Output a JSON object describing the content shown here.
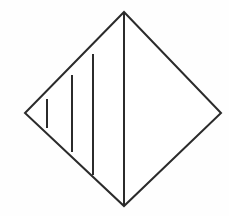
{
  "figure": {
    "name": "diamond-with-vertical-chords",
    "canvas": {
      "width": 229,
      "height": 216,
      "background_color": "#fefefe"
    },
    "style": {
      "stroke_color": "#2b2b2b",
      "stroke_width": 2,
      "fill_color": "#ffffff"
    },
    "outline": {
      "shape": "rhombus",
      "points": "124,12 221,113 124,206 25,113",
      "vertices": [
        {
          "label": "top",
          "x": 124,
          "y": 12
        },
        {
          "label": "right",
          "x": 221,
          "y": 113
        },
        {
          "label": "bottom",
          "x": 124,
          "y": 206
        },
        {
          "label": "left",
          "x": 25,
          "y": 113
        }
      ]
    },
    "chords": [
      {
        "label": "chord-1",
        "x": 47,
        "y1": 99,
        "y2": 128
      },
      {
        "label": "chord-2",
        "x": 72,
        "y1": 75,
        "y2": 152
      },
      {
        "label": "chord-3",
        "x": 93,
        "y1": 54,
        "y2": 175
      }
    ],
    "axis": {
      "label": "vertical-axis",
      "x": 124,
      "y1": 12,
      "y2": 206
    }
  }
}
